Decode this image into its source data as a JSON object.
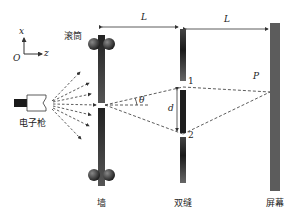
{
  "labels": {
    "axis_x": "x",
    "axis_z": "z",
    "origin": "O",
    "roller": "滚筒",
    "electron_gun": "电子枪",
    "wall": "墙",
    "double_slit": "双缝",
    "screen": "屏幕",
    "distance_1": "L",
    "distance_2": "L",
    "slit_1": "1",
    "slit_2": "2",
    "point_p": "P",
    "angle": "θ",
    "slit_separation": "d"
  },
  "colors": {
    "wall": "#2a2a2a",
    "slit_plate": "#222222",
    "screen": "#5a5a5a",
    "roller": "#3a3a3a",
    "dashed": "#333333"
  }
}
